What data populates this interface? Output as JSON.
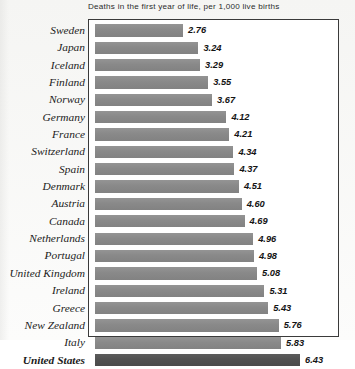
{
  "chart_data": {
    "type": "bar",
    "orientation": "horizontal",
    "title": "Deaths in the first year of life, per 1,000 live births",
    "xlabel": "",
    "ylabel": "",
    "xlim": [
      0,
      6.43
    ],
    "grid": false,
    "legend": false,
    "value_format": "2 decimals",
    "categories": [
      "Sweden",
      "Japan",
      "Iceland",
      "Finland",
      "Norway",
      "Germany",
      "France",
      "Switzerland",
      "Spain",
      "Denmark",
      "Austria",
      "Canada",
      "Netherlands",
      "Portugal",
      "United Kingdom",
      "Ireland",
      "Greece",
      "New Zealand",
      "Italy",
      "United States"
    ],
    "values": [
      2.76,
      3.24,
      3.29,
      3.55,
      3.67,
      4.12,
      4.21,
      4.34,
      4.37,
      4.51,
      4.6,
      4.69,
      4.96,
      4.98,
      5.08,
      5.31,
      5.43,
      5.76,
      5.83,
      6.43
    ],
    "value_labels": [
      "2.76",
      "3.24",
      "3.29",
      "3.55",
      "3.67",
      "4.12",
      "4.21",
      "4.34",
      "4.37",
      "4.51",
      "4.60",
      "4.69",
      "4.96",
      "4.98",
      "5.08",
      "5.31",
      "5.43",
      "5.76",
      "5.83",
      "6.43"
    ],
    "highlighted_category": "United States",
    "colors": {
      "bar": "#8d8d8d",
      "bar_highlight": "#555555",
      "frame": "#3a3a3a",
      "text": "#1b1b1b",
      "background": "#fbfbfa"
    }
  }
}
